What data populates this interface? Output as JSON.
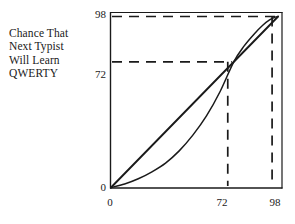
{
  "figure": {
    "caption_lines": [
      "Chance That",
      "Next Typist",
      "Will Learn",
      "QWERTY"
    ],
    "ink_color": "#1a1a1a",
    "background_color": "#ffffff"
  },
  "labels": {
    "y_98": "98",
    "y_72": "72",
    "y_0": "0",
    "x_0": "0",
    "x_72": "72",
    "x_98": "98"
  },
  "chart_data": {
    "type": "line",
    "title": "",
    "subtitle": "",
    "xlabel": "",
    "ylabel": "Chance That Next Typist Will Learn QWERTY",
    "xlim": [
      0,
      100
    ],
    "ylim": [
      0,
      100
    ],
    "grid": false,
    "legend": null,
    "x_ticks": [
      0,
      72,
      98
    ],
    "x_tick_labels": [
      "0",
      "72",
      "98"
    ],
    "y_ticks": [
      0,
      72,
      98
    ],
    "y_tick_labels": [
      "0",
      "72",
      "98"
    ],
    "series": [
      {
        "name": "45-degree line",
        "style": "solid",
        "x": [
          0,
          98
        ],
        "values": [
          0,
          98
        ]
      },
      {
        "name": "adoption probability curve",
        "style": "solid",
        "x": [
          0,
          8,
          16,
          24,
          32,
          40,
          48,
          56,
          64,
          72,
          78,
          84,
          89,
          93,
          96,
          98
        ],
        "values": [
          0,
          2,
          5,
          9,
          14,
          21,
          30,
          41,
          55,
          72,
          81,
          88,
          93,
          96,
          97.5,
          98
        ]
      }
    ],
    "reference_lines": [
      {
        "name": "horizontal-98",
        "orientation": "horizontal",
        "value": 98,
        "style": "dashed",
        "from_x": 0,
        "to_x": 98
      },
      {
        "name": "horizontal-72",
        "orientation": "horizontal",
        "value": 72,
        "style": "dashed",
        "from_x": 0,
        "to_x": 72
      },
      {
        "name": "vertical-72",
        "orientation": "vertical",
        "value": 72,
        "style": "dashed",
        "from_y": 0,
        "to_y": 72
      },
      {
        "name": "vertical-98",
        "orientation": "vertical",
        "value": 98,
        "style": "dashed",
        "from_y": 0,
        "to_y": 98
      }
    ],
    "intersection_points": [
      {
        "x": 72,
        "y": 72
      },
      {
        "x": 98,
        "y": 98
      },
      {
        "x": 0,
        "y": 0
      }
    ]
  }
}
